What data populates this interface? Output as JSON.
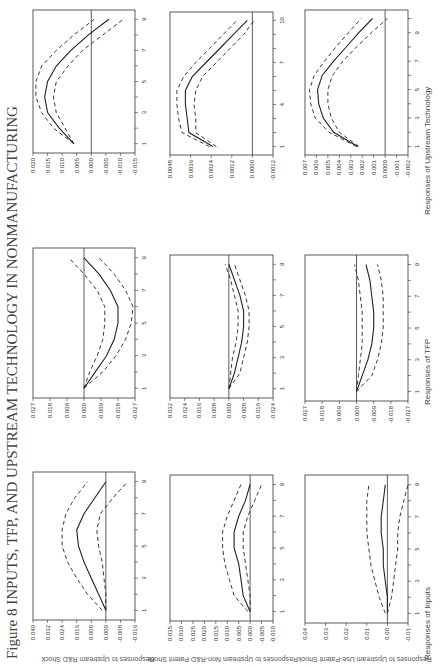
{
  "figure": {
    "title": "Figure 8 INPUTS, TFP, AND UPSTREAM TECHNOLOGY IN NONMANUFACTURING",
    "orientation": "rotated 90° counter-clockwise",
    "row_labels": [
      "Responses to Upstream R&D Shock",
      "Responses to Upstream Non-R&D Patent Shock",
      "Responses to Upstream Use-Patent Shock"
    ],
    "column_labels": [
      "Responses of Inputs",
      "Responses of TFP",
      "Responses of Upstream Technology"
    ]
  },
  "chart_data": [
    {
      "type": "line",
      "shock": "Upstream R&D Shock",
      "response": "Responses of Inputs",
      "x": [
        1,
        2,
        3,
        4,
        5,
        6,
        7,
        8,
        9
      ],
      "xticks": [
        1,
        3,
        5,
        7,
        9
      ],
      "yticks": [
        0.04,
        0.032,
        0.024,
        0.016,
        0.008,
        0.0,
        -0.008,
        -0.016
      ],
      "ylim": [
        -0.016,
        0.04
      ],
      "series": [
        {
          "name": "impulse response",
          "style": "solid",
          "values": [
            0.0,
            0.004,
            0.008,
            0.012,
            0.015,
            0.016,
            0.012,
            0.006,
            0.0
          ]
        },
        {
          "name": "upper band",
          "style": "dashed",
          "values": [
            0.002,
            0.01,
            0.016,
            0.021,
            0.024,
            0.024,
            0.022,
            0.017,
            0.01
          ]
        },
        {
          "name": "lower band",
          "style": "dashed",
          "values": [
            0.0,
            0.0,
            0.001,
            0.002,
            0.004,
            0.005,
            0.003,
            -0.004,
            -0.012
          ]
        }
      ]
    },
    {
      "type": "line",
      "shock": "Upstream R&D Shock",
      "response": "Responses of TFP",
      "x": [
        1,
        2,
        3,
        4,
        5,
        6,
        7,
        8,
        9
      ],
      "xticks": [
        1,
        3,
        5,
        7,
        9
      ],
      "yticks": [
        0.027,
        0.018,
        0.009,
        0.0,
        -0.009,
        -0.018,
        -0.027
      ],
      "ylim": [
        -0.027,
        0.027
      ],
      "series": [
        {
          "name": "impulse response",
          "style": "solid",
          "values": [
            0.0,
            -0.006,
            -0.012,
            -0.016,
            -0.018,
            -0.018,
            -0.014,
            -0.008,
            0.0
          ]
        },
        {
          "name": "upper band",
          "style": "dashed",
          "values": [
            0.0,
            -0.003,
            -0.007,
            -0.01,
            -0.011,
            -0.011,
            -0.007,
            0.0,
            0.008
          ]
        },
        {
          "name": "lower band",
          "style": "dashed",
          "values": [
            0.0,
            -0.01,
            -0.017,
            -0.022,
            -0.025,
            -0.026,
            -0.022,
            -0.016,
            -0.008
          ]
        }
      ]
    },
    {
      "type": "line",
      "shock": "Upstream R&D Shock",
      "response": "Responses of Upstream Technology",
      "x": [
        1,
        2,
        3,
        4,
        5,
        6,
        7,
        8,
        9
      ],
      "xticks": [
        1,
        3,
        5,
        7,
        9
      ],
      "yticks": [
        0.02,
        0.015,
        0.01,
        0.005,
        0.0,
        -0.005,
        -0.01,
        -0.015
      ],
      "ylim": [
        -0.015,
        0.02
      ],
      "series": [
        {
          "name": "impulse response",
          "style": "solid",
          "values": [
            0.006,
            0.011,
            0.015,
            0.016,
            0.015,
            0.012,
            0.007,
            0.001,
            -0.006
          ]
        },
        {
          "name": "upper band",
          "style": "dashed",
          "values": [
            0.006,
            0.013,
            0.017,
            0.019,
            0.019,
            0.017,
            0.012,
            0.006,
            -0.001
          ]
        },
        {
          "name": "lower band",
          "style": "dashed",
          "values": [
            0.006,
            0.009,
            0.012,
            0.013,
            0.012,
            0.008,
            0.003,
            -0.004,
            -0.011
          ]
        }
      ]
    },
    {
      "type": "line",
      "shock": "Upstream Non-R&D Patent Shock",
      "response": "Responses of Inputs",
      "x": [
        1,
        2,
        3,
        4,
        5,
        6,
        7,
        8,
        9
      ],
      "xticks": [
        1,
        3,
        5,
        7,
        9
      ],
      "yticks": [
        0.035,
        0.03,
        0.025,
        0.02,
        0.015,
        0.01,
        0.005,
        0.0,
        -0.005,
        -0.01
      ],
      "ylim": [
        -0.01,
        0.035
      ],
      "series": [
        {
          "name": "impulse response",
          "style": "solid",
          "values": [
            0.0,
            0.003,
            0.004,
            0.005,
            0.007,
            0.007,
            0.005,
            0.002,
            0.0
          ]
        },
        {
          "name": "upper band",
          "style": "dashed",
          "values": [
            0.001,
            0.007,
            0.009,
            0.011,
            0.012,
            0.012,
            0.01,
            0.007,
            0.004
          ]
        },
        {
          "name": "lower band",
          "style": "dashed",
          "values": [
            0.0,
            0.0,
            0.001,
            0.002,
            0.003,
            0.003,
            0.001,
            -0.002,
            -0.005
          ]
        }
      ]
    },
    {
      "type": "line",
      "shock": "Upstream Non-R&D Patent Shock",
      "response": "Responses of TFP",
      "x": [
        1,
        2,
        3,
        4,
        5,
        6,
        7,
        8,
        9
      ],
      "xticks": [
        1,
        3,
        5,
        7,
        9
      ],
      "yticks": [
        0.032,
        0.024,
        0.016,
        0.008,
        0.0,
        -0.008,
        -0.016,
        -0.024
      ],
      "ylim": [
        -0.024,
        0.032
      ],
      "series": [
        {
          "name": "impulse response",
          "style": "solid",
          "values": [
            0.0,
            -0.003,
            -0.005,
            -0.007,
            -0.008,
            -0.008,
            -0.006,
            -0.003,
            0.0
          ]
        },
        {
          "name": "upper band",
          "style": "dashed",
          "values": [
            0.0,
            -0.001,
            -0.002,
            -0.004,
            -0.005,
            -0.005,
            -0.003,
            -0.001,
            0.002
          ]
        },
        {
          "name": "lower band",
          "style": "dashed",
          "values": [
            0.0,
            -0.006,
            -0.008,
            -0.01,
            -0.011,
            -0.011,
            -0.009,
            -0.006,
            -0.003
          ]
        }
      ]
    },
    {
      "type": "line",
      "shock": "Upstream Non-R&D Patent Shock",
      "response": "Responses of Upstream Technology",
      "x": [
        1,
        2,
        3,
        4,
        5,
        6,
        7,
        8,
        9,
        10
      ],
      "xticks": [
        1,
        4,
        7,
        10
      ],
      "yticks": [
        0.0048,
        0.0036,
        0.0024,
        0.0012,
        0.0,
        -0.0012
      ],
      "ylim": [
        -0.0012,
        0.0048
      ],
      "series": [
        {
          "name": "impulse response",
          "style": "solid",
          "values": [
            0.0023,
            0.0037,
            0.0038,
            0.0039,
            0.0039,
            0.0035,
            0.0027,
            0.0019,
            0.0011,
            0.0003
          ]
        },
        {
          "name": "upper band",
          "style": "dashed",
          "values": [
            0.0025,
            0.0041,
            0.0043,
            0.0044,
            0.0044,
            0.004,
            0.0033,
            0.0025,
            0.0017,
            0.0009
          ]
        },
        {
          "name": "lower band",
          "style": "dashed",
          "values": [
            0.0021,
            0.0033,
            0.0033,
            0.0034,
            0.0033,
            0.0029,
            0.0021,
            0.0013,
            0.0005,
            -0.0001
          ]
        }
      ]
    },
    {
      "type": "line",
      "shock": "Upstream Use-Patent Shock",
      "response": "Responses of Inputs",
      "x": [
        1,
        2,
        3,
        4,
        5,
        6,
        7,
        8,
        9
      ],
      "xticks": [
        1,
        3,
        5,
        7,
        9
      ],
      "yticks": [
        0.04,
        0.03,
        0.02,
        0.01,
        0.0,
        -0.01
      ],
      "ylim": [
        -0.01,
        0.04
      ],
      "series": [
        {
          "name": "impulse response",
          "style": "solid",
          "values": [
            0.0,
            0.0,
            0.001,
            0.002,
            0.002,
            0.003,
            0.003,
            0.002,
            0.001
          ]
        },
        {
          "name": "upper band",
          "style": "dashed",
          "values": [
            0.001,
            0.004,
            0.006,
            0.008,
            0.009,
            0.01,
            0.01,
            0.01,
            0.009
          ]
        },
        {
          "name": "lower band",
          "style": "dashed",
          "values": [
            0.0,
            -0.002,
            -0.003,
            -0.004,
            -0.005,
            -0.005,
            -0.006,
            -0.008,
            -0.01
          ]
        }
      ]
    },
    {
      "type": "line",
      "shock": "Upstream Use-Patent Shock",
      "response": "Responses of TFP",
      "x": [
        1,
        2,
        3,
        4,
        5,
        6,
        7,
        8,
        9
      ],
      "xticks": [
        1,
        3,
        5,
        7,
        9
      ],
      "yticks": [
        0.027,
        0.018,
        0.009,
        0.0,
        -0.009,
        -0.018,
        -0.027
      ],
      "ylim": [
        -0.027,
        0.027
      ],
      "series": [
        {
          "name": "impulse response",
          "style": "solid",
          "values": [
            0.0,
            -0.003,
            -0.006,
            -0.008,
            -0.009,
            -0.009,
            -0.008,
            -0.007,
            -0.005
          ]
        },
        {
          "name": "upper band",
          "style": "dashed",
          "values": [
            0.0,
            -0.001,
            -0.002,
            -0.003,
            -0.003,
            -0.003,
            -0.002,
            -0.001,
            0.001
          ]
        },
        {
          "name": "lower band",
          "style": "dashed",
          "values": [
            0.0,
            -0.008,
            -0.011,
            -0.013,
            -0.014,
            -0.014,
            -0.014,
            -0.013,
            -0.011
          ]
        }
      ]
    },
    {
      "type": "line",
      "shock": "Upstream Use-Patent Shock",
      "response": "Responses of Upstream Technology",
      "x": [
        1,
        2,
        3,
        4,
        5,
        6,
        7,
        8,
        9,
        10
      ],
      "xticks": [
        1,
        3,
        5,
        7,
        9
      ],
      "yticks": [
        0.007,
        0.006,
        0.005,
        0.004,
        0.003,
        0.002,
        0.001,
        0.0,
        -0.001,
        -0.002
      ],
      "ylim": [
        -0.002,
        0.007
      ],
      "series": [
        {
          "name": "impulse response",
          "style": "solid",
          "values": [
            0.0024,
            0.0045,
            0.0054,
            0.0058,
            0.0059,
            0.0055,
            0.0045,
            0.0034,
            0.0023,
            0.0011
          ]
        },
        {
          "name": "upper band",
          "style": "dashed",
          "values": [
            0.0025,
            0.0049,
            0.0061,
            0.0065,
            0.0066,
            0.0062,
            0.0053,
            0.0043,
            0.0032,
            0.0021
          ]
        },
        {
          "name": "lower band",
          "style": "dashed",
          "values": [
            0.0023,
            0.004,
            0.0047,
            0.005,
            0.005,
            0.0046,
            0.0037,
            0.0025,
            0.0012,
            -0.0002
          ]
        }
      ]
    }
  ]
}
